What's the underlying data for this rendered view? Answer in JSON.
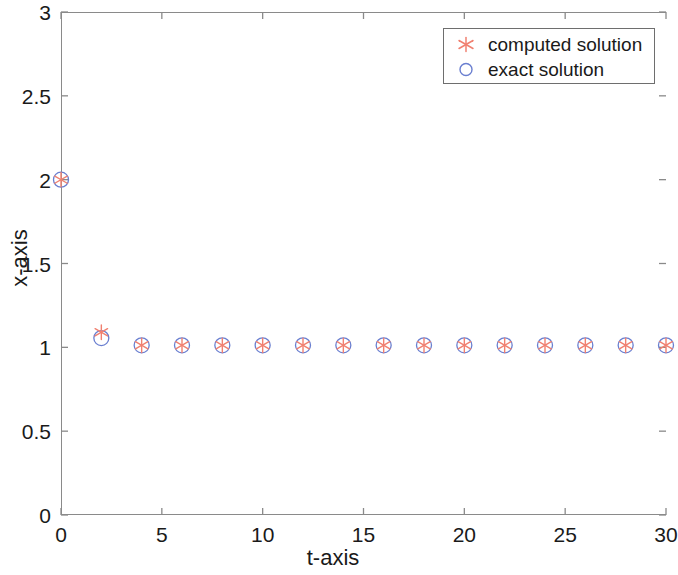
{
  "chart_data": {
    "type": "scatter",
    "title": "",
    "xlabel": "t-axis",
    "ylabel": "x-axis",
    "xlim": [
      0,
      30
    ],
    "ylim": [
      0,
      3
    ],
    "xticks": [
      0,
      5,
      10,
      15,
      20,
      25,
      30
    ],
    "yticks": [
      0,
      0.5,
      1,
      1.5,
      2,
      2.5,
      3
    ],
    "xtick_labels": [
      "0",
      "5",
      "10",
      "15",
      "20",
      "25",
      "30"
    ],
    "ytick_labels": [
      "0",
      "0.5",
      "1",
      "1.5",
      "2",
      "2.5",
      "3"
    ],
    "grid": false,
    "legend_position": "top-right",
    "series": [
      {
        "name": "computed solution",
        "marker": "asterisk",
        "color": "#f08070",
        "x": [
          0,
          2,
          4,
          6,
          8,
          10,
          12,
          14,
          16,
          18,
          20,
          22,
          24,
          26,
          28,
          30
        ],
        "values": [
          2.0,
          1.09,
          1.012,
          1.012,
          1.012,
          1.012,
          1.012,
          1.012,
          1.012,
          1.012,
          1.012,
          1.012,
          1.012,
          1.012,
          1.012,
          1.012
        ]
      },
      {
        "name": "exact solution",
        "marker": "circle",
        "color": "#6a7fd0",
        "x": [
          0,
          2,
          4,
          6,
          8,
          10,
          12,
          14,
          16,
          18,
          20,
          22,
          24,
          26,
          28,
          30
        ],
        "values": [
          2.0,
          1.055,
          1.012,
          1.012,
          1.012,
          1.012,
          1.012,
          1.012,
          1.012,
          1.012,
          1.012,
          1.012,
          1.012,
          1.012,
          1.012,
          1.012
        ]
      }
    ]
  },
  "legend": {
    "entries": [
      {
        "label": "computed solution",
        "marker": "asterisk-marker-icon"
      },
      {
        "label": "exact solution",
        "marker": "circle-marker-icon"
      }
    ]
  },
  "axes": {
    "x_title": "t-axis",
    "y_title": "x-axis"
  },
  "colors": {
    "computed": "#f08070",
    "exact": "#6a7fd0",
    "frame": "#8a8a8a",
    "text": "#1a1a1a",
    "background": "#ffffff"
  }
}
